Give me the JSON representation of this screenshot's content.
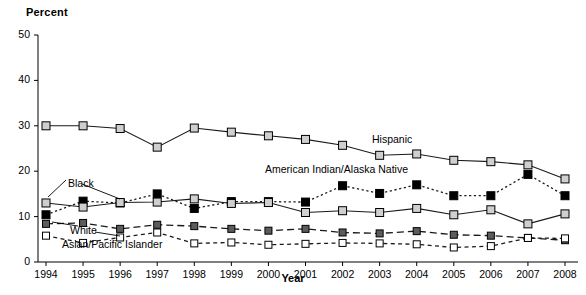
{
  "chart_data": {
    "type": "line",
    "title": "",
    "ylabel": "Percent",
    "xlabel": "Year",
    "ylim": [
      0,
      50
    ],
    "yticks": [
      0,
      10,
      20,
      30,
      40,
      50
    ],
    "grid": false,
    "legend_position": "inline-annotations",
    "categories": [
      "1994",
      "1995",
      "1996",
      "1997",
      "1998",
      "1999",
      "2000",
      "2001",
      "2002",
      "2003",
      "2004",
      "2005",
      "2006",
      "2007",
      "2008"
    ],
    "x": [
      1994,
      1995,
      1996,
      1997,
      1998,
      1999,
      2000,
      2001,
      2002,
      2003,
      2004,
      2005,
      2006,
      2007,
      2008
    ],
    "series": [
      {
        "name": "Hispanic",
        "marker": "square-light-gray",
        "line": "solid",
        "color": "#cccccc",
        "values": [
          30.0,
          30.0,
          29.4,
          25.3,
          29.5,
          28.6,
          27.8,
          27.0,
          25.7,
          23.5,
          23.8,
          22.4,
          22.1,
          21.4,
          18.3
        ]
      },
      {
        "name": "American Indian/Alaska Native",
        "marker": "square-black",
        "line": "dotted",
        "color": "#000000",
        "values": [
          10.4,
          13.4,
          13.0,
          15.0,
          11.8,
          13.3,
          13.3,
          13.2,
          16.8,
          15.1,
          17.0,
          14.6,
          14.6,
          19.3,
          14.6
        ]
      },
      {
        "name": "Black",
        "marker": "square-light-gray",
        "line": "solid",
        "color": "#cccccc",
        "values": [
          13.0,
          12.1,
          13.1,
          13.2,
          13.9,
          12.9,
          13.1,
          10.9,
          11.3,
          10.9,
          11.8,
          10.4,
          11.5,
          8.4,
          10.6
        ]
      },
      {
        "name": "White",
        "marker": "square-dark-gray",
        "line": "dashed",
        "color": "#5c5c5c",
        "values": [
          8.4,
          8.6,
          7.3,
          8.2,
          7.9,
          7.3,
          6.9,
          7.3,
          6.5,
          6.3,
          6.8,
          6.0,
          5.8,
          5.3,
          4.8
        ]
      },
      {
        "name": "Asian/Pacific Islander",
        "marker": "square-white",
        "line": "short-dashed",
        "color": "#ffffff",
        "values": [
          5.8,
          4.2,
          5.4,
          6.5,
          4.1,
          4.3,
          3.8,
          4.0,
          4.2,
          4.1,
          3.9,
          3.2,
          3.5,
          5.3,
          5.2
        ]
      }
    ],
    "annotations": [
      {
        "text": "Hispanic",
        "x": 372,
        "y": 133
      },
      {
        "text": "American Indian/Alaska Native",
        "x": 265,
        "y": 163
      },
      {
        "text": "Black",
        "x": 68,
        "y": 177
      },
      {
        "text": "White",
        "x": 70,
        "y": 224
      },
      {
        "text": "Asian/Pacific Islander",
        "x": 62,
        "y": 238
      }
    ]
  },
  "axis": {
    "y_ticks": [
      "50",
      "40",
      "30",
      "20",
      "10",
      "0"
    ],
    "x_ticks": [
      "1994",
      "1995",
      "1996",
      "1997",
      "1998",
      "1999",
      "2000",
      "2001",
      "2002",
      "2003",
      "2004",
      "2005",
      "2006",
      "2007",
      "2008"
    ]
  },
  "labels": {
    "y_axis_title": "Percent",
    "x_axis_title": "Year"
  }
}
